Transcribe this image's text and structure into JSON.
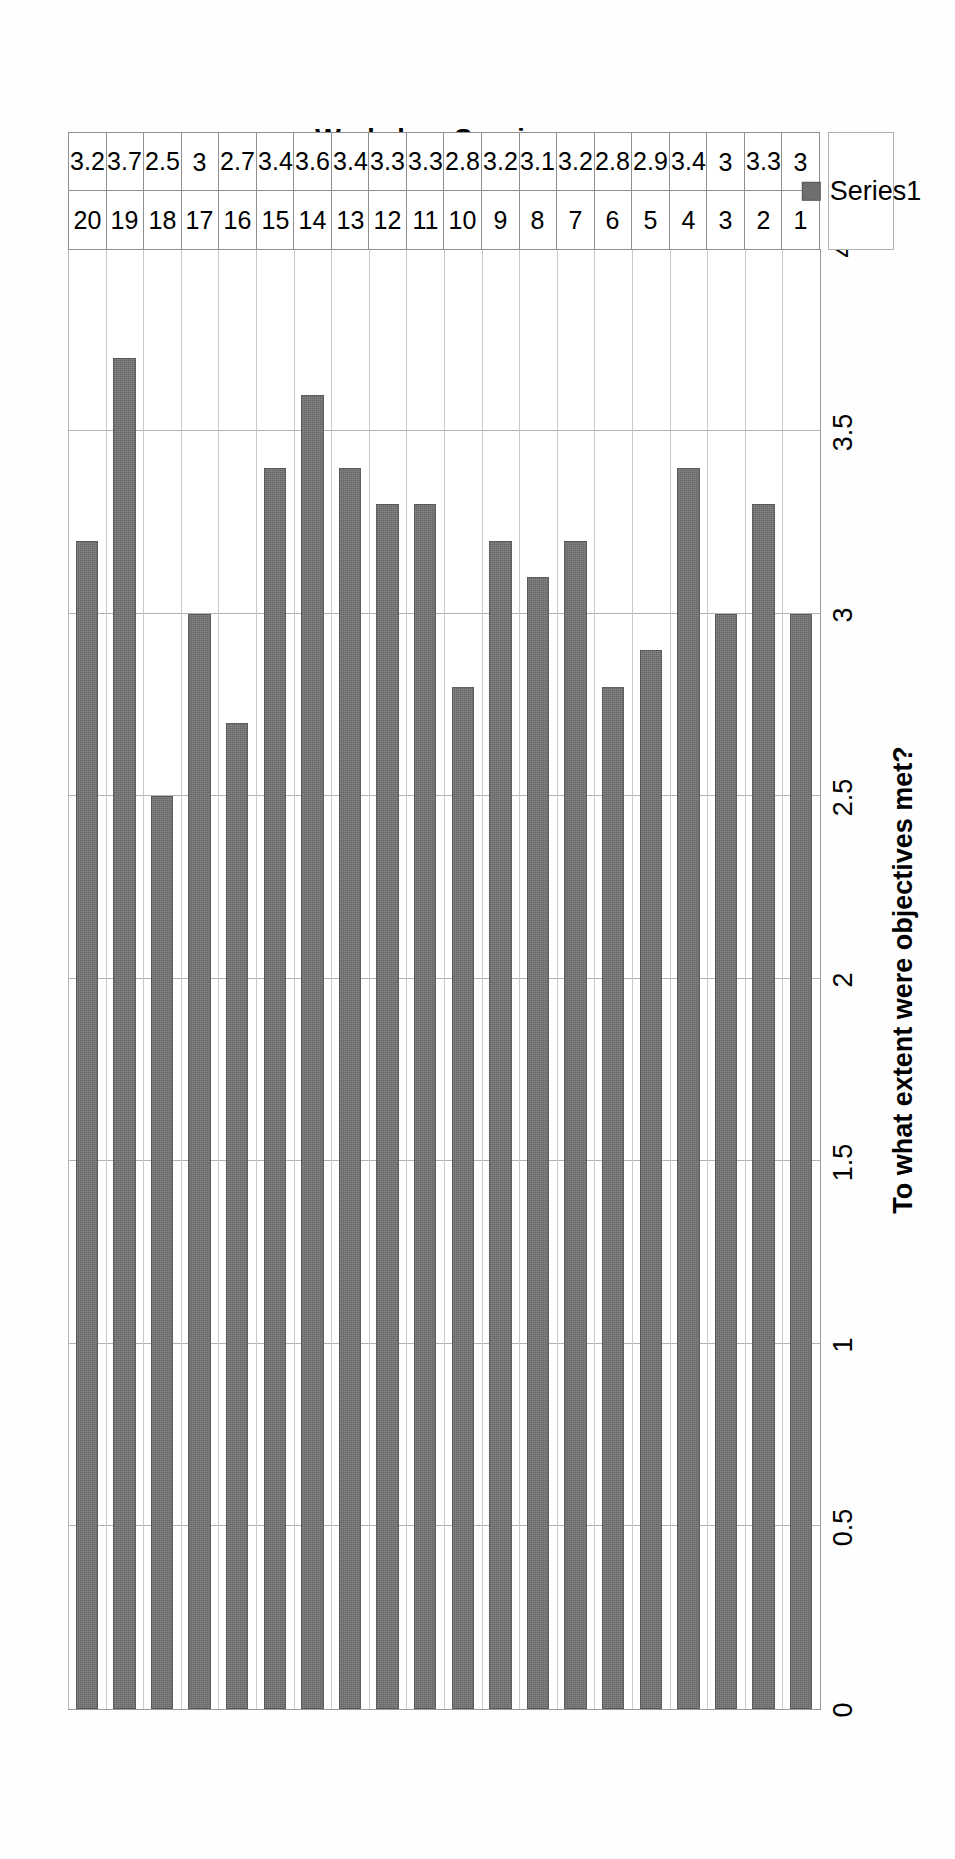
{
  "chart_data": {
    "type": "bar",
    "orientation": "horizontal",
    "title": "",
    "xlabel": "To what extent were objectives met?",
    "ylabel": "Workshop Sessions",
    "categories": [
      "1",
      "2",
      "3",
      "4",
      "5",
      "6",
      "7",
      "8",
      "9",
      "10",
      "11",
      "12",
      "13",
      "14",
      "15",
      "16",
      "17",
      "18",
      "19",
      "20"
    ],
    "values": [
      3,
      3.3,
      3,
      3.4,
      2.9,
      2.8,
      3.2,
      3.1,
      3.2,
      2.8,
      3.3,
      3.3,
      3.4,
      3.6,
      3.4,
      2.7,
      3,
      2.5,
      3.7,
      3.2
    ],
    "value_labels": [
      "3",
      "3.3",
      "3",
      "3.4",
      "2.9",
      "2.8",
      "3.2",
      "3.1",
      "3.2",
      "2.8",
      "3.3",
      "3.3",
      "3.4",
      "3.6",
      "3.4",
      "2.7",
      "3",
      "2.5",
      "3.7",
      "3.2"
    ],
    "series": [
      {
        "name": "Series1",
        "values": [
          3,
          3.3,
          3,
          3.4,
          2.9,
          2.8,
          3.2,
          3.1,
          3.2,
          2.8,
          3.3,
          3.3,
          3.4,
          3.6,
          3.4,
          2.7,
          3,
          2.5,
          3.7,
          3.2
        ]
      }
    ],
    "value_axis": {
      "min": 0,
      "max": 4,
      "step": 0.5,
      "tick_labels": [
        "0",
        "0.5",
        "1",
        "1.5",
        "2",
        "2.5",
        "3",
        "3.5",
        "4"
      ]
    },
    "grid": true,
    "legend_position": "bottom-right",
    "data_table_visible": true,
    "data_table_row_header": "Series1",
    "colors": {
      "bar_fill": "#6e6e6e",
      "gridline": "#b3b3b3",
      "axis_line": "#9a9a9a",
      "table_border": "#8f8f8f",
      "text": "#000000",
      "background": "#ffffff"
    }
  },
  "legend": {
    "label": "Series1"
  },
  "axis_titles": {
    "value": "To what extent were objectives met?",
    "category": "Workshop Sessions"
  }
}
